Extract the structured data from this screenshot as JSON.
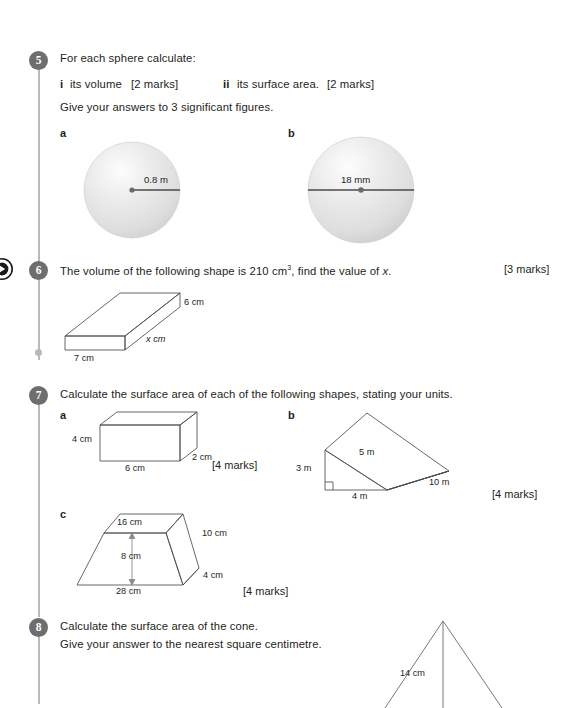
{
  "page": {
    "width": 566,
    "height": 704,
    "background": "#ffffff",
    "ink": "#231f20",
    "badge_color": "#6e6e6e",
    "rule_color": "#b9b9b9",
    "sphere_fill": "#e3e3e3"
  },
  "questions": [
    {
      "number": "5",
      "lines": [
        "For each sphere calculate:",
        "Give your answers to 3 significant figures."
      ],
      "parts_inline": {
        "i_marker": "i",
        "i_text": "its volume",
        "i_marks": "[2 marks]",
        "ii_marker": "ii",
        "ii_text": "its surface area.",
        "ii_marks": "[2 marks]"
      },
      "diagrams": [
        {
          "label": "a",
          "shape": "sphere",
          "measure": "0.8 m",
          "measure_type": "radius"
        },
        {
          "label": "b",
          "shape": "sphere",
          "measure": "18 mm",
          "measure_type": "diameter"
        }
      ]
    },
    {
      "number": "6",
      "text_before": "The volume of the following shape is 210 cm",
      "text_sup": "3",
      "text_after": ", find the value of ",
      "text_var": "x",
      "text_end": ".",
      "marks": "[3 marks]",
      "diagram": {
        "shape": "cuboid",
        "labels": [
          "6 cm",
          "x cm",
          "7 cm"
        ]
      }
    },
    {
      "number": "7",
      "text": "Calculate the surface area of each of the following shapes, stating your units.",
      "parts": [
        {
          "label": "a",
          "shape": "cuboid",
          "labels": [
            "4 cm",
            "2 cm",
            "6 cm"
          ],
          "marks": "[4 marks]"
        },
        {
          "label": "b",
          "shape": "triangular-prism",
          "labels": [
            "3 m",
            "5 m",
            "10 m",
            "4 m"
          ],
          "marks": "[4 marks]"
        },
        {
          "label": "c",
          "shape": "trapezoidal-prism",
          "labels": [
            "16 cm",
            "10 cm",
            "8 cm",
            "4 cm",
            "28 cm"
          ],
          "marks": "[4 marks]"
        }
      ]
    },
    {
      "number": "8",
      "lines": [
        "Calculate the surface area of the cone.",
        "Give your answer to the nearest square centimetre."
      ],
      "diagram": {
        "shape": "cone",
        "labels": [
          "14 cm"
        ]
      }
    }
  ]
}
